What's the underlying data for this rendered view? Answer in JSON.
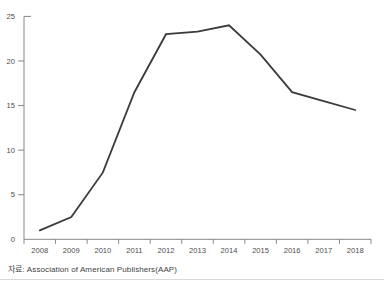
{
  "chart_data": {
    "type": "line",
    "title": "",
    "xlabel": "",
    "ylabel": "",
    "categories": [
      "2008",
      "2009",
      "2010",
      "2011",
      "2012",
      "2013",
      "2014",
      "2015",
      "2016",
      "2017",
      "2018"
    ],
    "values": [
      1,
      2.5,
      7.5,
      16.5,
      23,
      23.3,
      24,
      20.7,
      16.5,
      15.5,
      14.5
    ],
    "ylim": [
      0,
      25
    ],
    "yticks": [
      0,
      5,
      10,
      15,
      20,
      25
    ],
    "grid": false,
    "legend": "none",
    "line_color": "#3b3b3b",
    "axis_color": "#878787",
    "tick_label_color": "#4d4d4d"
  },
  "source_note": {
    "label": "자료: Association of American Publishers(AAP)"
  }
}
